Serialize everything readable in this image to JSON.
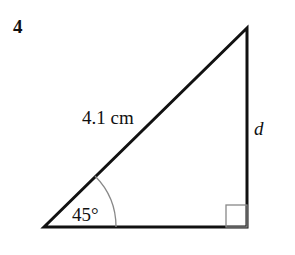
{
  "question_number": "4",
  "triangle": {
    "hypotenuse_label": "4.1 cm",
    "vertical_side_label": "d",
    "angle_label": "45°",
    "right_angle_marker": true
  },
  "colors": {
    "line": "#111111",
    "arc": "#888888"
  }
}
